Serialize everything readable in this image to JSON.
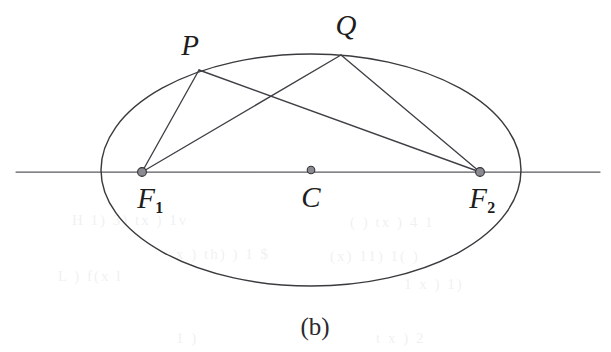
{
  "figure": {
    "caption": "(b)",
    "background_color": "#ffffff",
    "stroke_color": "#3b3b3f",
    "axis_color": "#5a5a60",
    "dot_fill_color": "#8a8a90",
    "label_color": "#1d1d20",
    "width": 611,
    "height": 352
  },
  "labels": [
    {
      "key": "P",
      "text": "P",
      "sub": "",
      "x": 190,
      "y": 45
    },
    {
      "key": "Q",
      "text": "Q",
      "sub": "",
      "x": 346,
      "y": 25
    },
    {
      "key": "F1",
      "text": "F",
      "sub": "1",
      "x": 150,
      "y": 198
    },
    {
      "key": "C",
      "text": "C",
      "sub": "",
      "x": 311,
      "y": 197
    },
    {
      "key": "F2",
      "text": "F",
      "sub": "2",
      "x": 482,
      "y": 198
    }
  ],
  "chart_data": {
    "type": "diagram",
    "subtype": "ellipse-focal-chords",
    "title": "(b)",
    "ellipse": {
      "center_x": 311,
      "center_y": 170,
      "semi_major_axis_rx": 210,
      "semi_minor_axis_ry": 116,
      "left_vertex_x": 101,
      "right_vertex_x": 521,
      "top_vertex_y": 54,
      "bottom_vertex_y": 286
    },
    "major_axis_line": {
      "label": "major-axis",
      "x1": 16,
      "y1": 172,
      "x2": 600,
      "y2": 172
    },
    "points": [
      {
        "name": "F1",
        "label": "F₁",
        "role": "focus",
        "x": 142,
        "y": 172,
        "marked": true
      },
      {
        "name": "C",
        "label": "C",
        "role": "center",
        "x": 311,
        "y": 170,
        "marked": true
      },
      {
        "name": "F2",
        "label": "F₂",
        "role": "focus",
        "x": 480,
        "y": 172,
        "marked": true
      },
      {
        "name": "P",
        "label": "P",
        "role": "point-on-ellipse",
        "x": 199,
        "y": 70,
        "marked": false
      },
      {
        "name": "Q",
        "label": "Q",
        "role": "point-on-ellipse",
        "x": 341,
        "y": 55,
        "marked": false
      }
    ],
    "segments": [
      {
        "name": "P-F1",
        "from": "P",
        "to": "F1",
        "x1": 199,
        "y1": 70,
        "x2": 142,
        "y2": 172
      },
      {
        "name": "P-F2",
        "from": "P",
        "to": "F2",
        "x1": 199,
        "y1": 70,
        "x2": 480,
        "y2": 172
      },
      {
        "name": "Q-F1",
        "from": "Q",
        "to": "F1",
        "x1": 341,
        "y1": 55,
        "x2": 142,
        "y2": 172
      },
      {
        "name": "Q-F2",
        "from": "Q",
        "to": "F2",
        "x1": 341,
        "y1": 55,
        "x2": 480,
        "y2": 172
      }
    ],
    "annotations": [
      "Ellipse with center C and foci F1, F2 on the horizontal major axis.",
      "Focal radii drawn from two points P and Q on the upper arc to both foci."
    ]
  },
  "bleed_through": [
    {
      "text": "H  1) 3) tx ) 1v",
      "x": 72,
      "y": 212,
      "size": 15,
      "rotate": 0
    },
    {
      "text": "x ) th)   ) 1 $",
      "x": 176,
      "y": 246,
      "size": 15,
      "rotate": 0
    },
    {
      "text": "L )  f(x  l",
      "x": 58,
      "y": 268,
      "size": 15,
      "rotate": 0
    },
    {
      "text": "( )  tx ) 4 1",
      "x": 350,
      "y": 214,
      "size": 15,
      "rotate": 0
    },
    {
      "text": "(x)  11)  1( )",
      "x": 330,
      "y": 248,
      "size": 15,
      "rotate": 0
    },
    {
      "text": "1 x )  1)",
      "x": 404,
      "y": 276,
      "size": 15,
      "rotate": 0
    },
    {
      "text": "t x )   2",
      "x": 376,
      "y": 330,
      "size": 15,
      "rotate": 0
    },
    {
      "text": "1  )",
      "x": 176,
      "y": 330,
      "size": 15,
      "rotate": 0
    }
  ]
}
